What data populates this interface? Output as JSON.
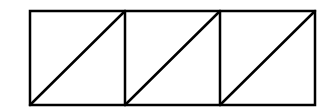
{
  "diagram": {
    "stroke_color": "#000000",
    "background_color": "#ffffff",
    "cells": [
      {
        "index": 1,
        "diagonal": "bottom-left to top-right"
      },
      {
        "index": 2,
        "diagonal": "bottom-left to top-right"
      },
      {
        "index": 3,
        "diagonal": "bottom-left to top-right"
      }
    ]
  }
}
